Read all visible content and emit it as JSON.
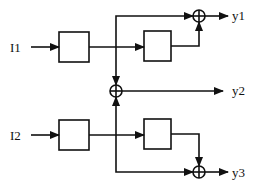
{
  "diagram": {
    "type": "block-diagram",
    "inputs": [
      {
        "id": "I1",
        "label": "I1"
      },
      {
        "id": "I2",
        "label": "I2"
      }
    ],
    "outputs": [
      {
        "id": "y1",
        "label": "y1"
      },
      {
        "id": "y2",
        "label": "y2"
      },
      {
        "id": "y3",
        "label": "y3"
      }
    ],
    "blocks": [
      {
        "id": "block-1",
        "label": ""
      },
      {
        "id": "block-2",
        "label": ""
      },
      {
        "id": "block-3",
        "label": ""
      },
      {
        "id": "block-4",
        "label": ""
      }
    ],
    "summing_junctions": [
      {
        "id": "sum-y1",
        "symbol": "⊕"
      },
      {
        "id": "sum-y2",
        "symbol": "⊕"
      },
      {
        "id": "sum-y3",
        "symbol": "⊕"
      }
    ],
    "connections": [
      {
        "from": "I1",
        "to": "block-1"
      },
      {
        "from": "block-1",
        "to": "block-2"
      },
      {
        "from": "block-1",
        "to": "sum-y1"
      },
      {
        "from": "block-1",
        "to": "sum-y2"
      },
      {
        "from": "block-2",
        "to": "sum-y1"
      },
      {
        "from": "sum-y1",
        "to": "y1"
      },
      {
        "from": "I2",
        "to": "block-3"
      },
      {
        "from": "block-3",
        "to": "block-4"
      },
      {
        "from": "block-3",
        "to": "sum-y2"
      },
      {
        "from": "block-3",
        "to": "sum-y3"
      },
      {
        "from": "block-4",
        "to": "sum-y3"
      },
      {
        "from": "sum-y2",
        "to": "y2"
      },
      {
        "from": "sum-y3",
        "to": "y3"
      }
    ],
    "colors": {
      "stroke": "#111111",
      "background": "#ffffff"
    }
  }
}
